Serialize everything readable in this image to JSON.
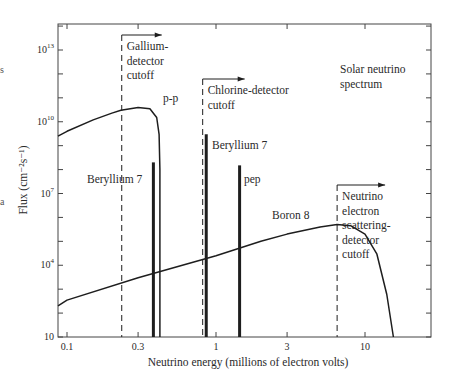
{
  "chart_data": {
    "type": "line",
    "xlabel": "Neutrino energy (millions of electron volts)",
    "ylabel": "Flux (cm⁻²s⁻¹)",
    "xscale": "log",
    "yscale": "log",
    "xlim": [
      0.085,
      30
    ],
    "ylim": [
      10,
      100000000000000.0
    ],
    "grid": false,
    "x_ticks": [
      {
        "value": 0.1,
        "label": "0.1"
      },
      {
        "value": 0.3,
        "label": "0.3"
      },
      {
        "value": 1,
        "label": "1"
      },
      {
        "value": 3,
        "label": "3"
      },
      {
        "value": 10,
        "label": "10"
      }
    ],
    "y_ticks": [
      {
        "value": 10,
        "label": "10",
        "exp": ""
      },
      {
        "value": 10000.0,
        "label": "10",
        "exp": "4"
      },
      {
        "value": 10000000.0,
        "label": "10",
        "exp": "7"
      },
      {
        "value": 10000000000.0,
        "label": "10",
        "exp": "10"
      },
      {
        "value": 10000000000000.0,
        "label": "10",
        "exp": "13"
      }
    ],
    "series": [
      {
        "name": "p-p",
        "kind": "continuum",
        "x": [
          0.085,
          0.1,
          0.15,
          0.2,
          0.23,
          0.3,
          0.36,
          0.4,
          0.415,
          0.42,
          0.42
        ],
        "y": [
          2500000000.0,
          4000000000.0,
          12000000000.0,
          23000000000.0,
          30000000000.0,
          40000000000.0,
          35000000000.0,
          15000000000.0,
          3000000000.0,
          100000000.0,
          10
        ]
      },
      {
        "name": "Boron 8",
        "kind": "continuum",
        "x": [
          0.085,
          0.1,
          0.3,
          1,
          2,
          3,
          5,
          6.5,
          8,
          10,
          12,
          14,
          15.5
        ],
        "y": [
          200,
          350,
          3000,
          25000.0,
          100000.0,
          200000.0,
          400000.0,
          500000.0,
          450000.0,
          200000.0,
          30000.0,
          600,
          10
        ]
      },
      {
        "name": "Beryllium 7",
        "kind": "line",
        "energy": 0.38,
        "flux": 200000000.0
      },
      {
        "name": "Beryllium 7",
        "kind": "line",
        "energy": 0.86,
        "flux": 3000000000.0
      },
      {
        "name": "pep",
        "kind": "line",
        "energy": 1.44,
        "flux": 150000000.0
      }
    ],
    "cutoffs": [
      {
        "name": "Gallium-detector cutoff",
        "energy": 0.233,
        "lines": [
          "Gallium-",
          "detector",
          "cutoff"
        ]
      },
      {
        "name": "Chlorine-detector cutoff",
        "energy": 0.814,
        "lines": [
          "Chlorine-detector",
          "cutoff"
        ]
      },
      {
        "name": "Neutrino electron scattering-detector cutoff",
        "energy": 6.5,
        "lines": [
          "Neutrino",
          "electron",
          "scattering-",
          "detector",
          "cutoff"
        ]
      }
    ],
    "annotations": [
      {
        "text": "p-p",
        "x_px": 163,
        "y_px": 102
      },
      {
        "text": "Beryllium 7",
        "x_px": 87,
        "y_px": 183
      },
      {
        "text": "Beryllium 7",
        "x_px": 212,
        "y_px": 149
      },
      {
        "text": "pep",
        "x_px": 244,
        "y_px": 183
      },
      {
        "text": "Boron 8",
        "x_px": 272,
        "y_px": 219
      }
    ],
    "title_lines": [
      "Solar neutrino",
      "spectrum"
    ]
  },
  "margin_fragments": [
    "s",
    "a"
  ]
}
